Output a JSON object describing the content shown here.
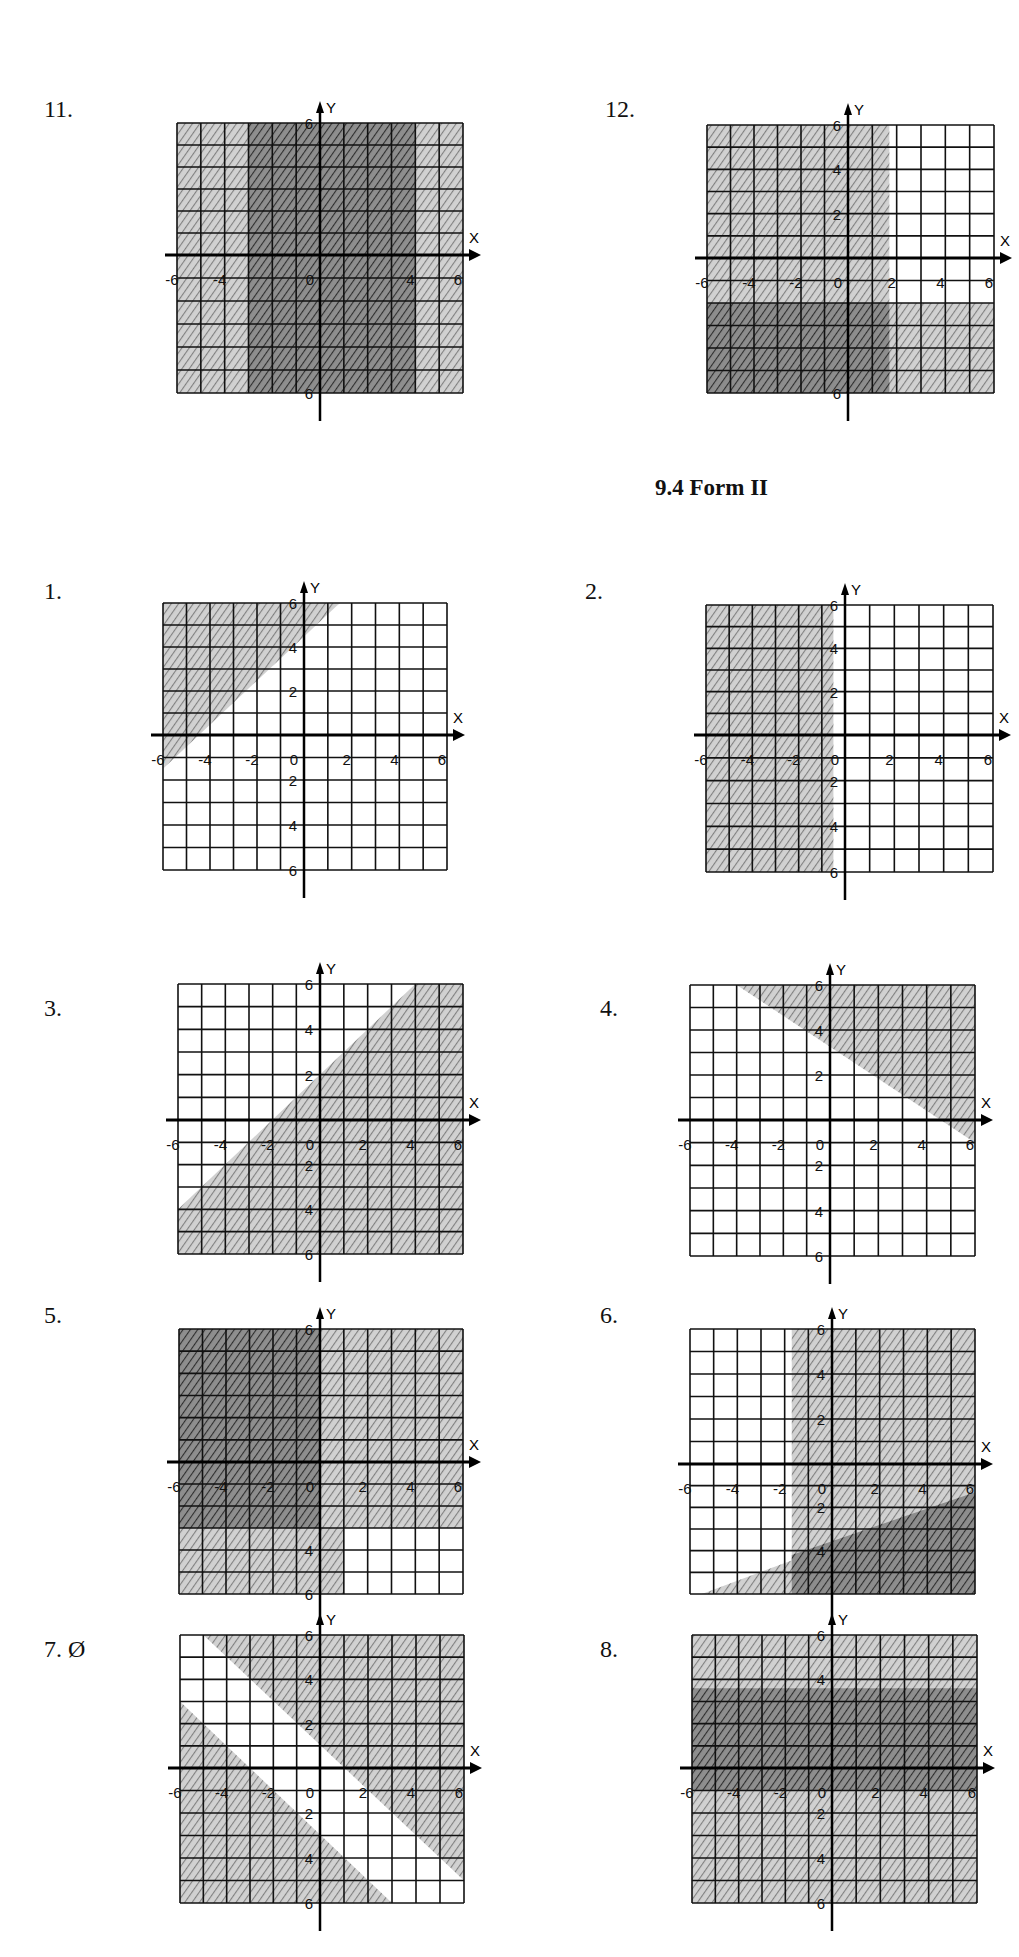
{
  "section_heading": "9.4 Form II",
  "problems": [
    {
      "label": "11.",
      "x": 44,
      "y": 96
    },
    {
      "label": "12.",
      "x": 605,
      "y": 96
    },
    {
      "label": "1.",
      "x": 44,
      "y": 578
    },
    {
      "label": "2.",
      "x": 585,
      "y": 578
    },
    {
      "label": "3.",
      "x": 44,
      "y": 995
    },
    {
      "label": "4.",
      "x": 600,
      "y": 995
    },
    {
      "label": "5.",
      "x": 44,
      "y": 1302
    },
    {
      "label": "6.",
      "x": 600,
      "y": 1302
    },
    {
      "label": "7. Ø",
      "x": 44,
      "y": 1636
    },
    {
      "label": "8.",
      "x": 600,
      "y": 1636
    }
  ],
  "colors": {
    "grid": "#111111",
    "shade_light": "#b5b5b5",
    "shade_dark": "#6e6e6e",
    "paper": "#ffffff"
  },
  "chart_data": [
    {
      "id": "11",
      "type": "region",
      "title": "11.",
      "xlabel": "X",
      "ylabel": "Y",
      "xlim": [
        -6,
        6
      ],
      "ylim": [
        -6,
        6
      ],
      "xticks": [
        -6,
        -4,
        0,
        4,
        6
      ],
      "yticks": [
        6,
        -6
      ],
      "box": [
        177,
        123,
        463,
        393
      ],
      "origin": [
        320,
        255
      ],
      "regions": [
        {
          "shade": "light",
          "poly": [
            [
              -6,
              6
            ],
            [
              6,
              6
            ],
            [
              6,
              -6
            ],
            [
              -6,
              -6
            ]
          ]
        },
        {
          "shade": "dark",
          "poly": [
            [
              -3,
              6
            ],
            [
              4,
              6
            ],
            [
              4,
              -6
            ],
            [
              -3,
              -6
            ]
          ]
        }
      ]
    },
    {
      "id": "12",
      "type": "region",
      "title": "12.",
      "xlabel": "X",
      "ylabel": "Y",
      "xlim": [
        -6,
        6
      ],
      "ylim": [
        -6,
        6
      ],
      "xticks": [
        -6,
        -4,
        -2,
        0,
        2,
        4,
        6
      ],
      "yticks": [
        6,
        4,
        2,
        -6
      ],
      "box": [
        707,
        125,
        994,
        393
      ],
      "origin": [
        848,
        258
      ],
      "regions": [
        {
          "shade": "light",
          "poly": [
            [
              -6,
              6
            ],
            [
              1.7,
              6
            ],
            [
              1.7,
              -6
            ],
            [
              -6,
              -6
            ]
          ]
        },
        {
          "shade": "light",
          "poly": [
            [
              -6,
              -2
            ],
            [
              6,
              -2
            ],
            [
              6,
              -6
            ],
            [
              -6,
              -6
            ]
          ]
        },
        {
          "shade": "dark",
          "poly": [
            [
              -6,
              -2
            ],
            [
              1.7,
              -2
            ],
            [
              1.7,
              -6
            ],
            [
              -6,
              -6
            ]
          ]
        }
      ]
    },
    {
      "id": "1",
      "type": "region",
      "title": "1.",
      "xlabel": "X",
      "ylabel": "Y",
      "xlim": [
        -6,
        6
      ],
      "ylim": [
        -6,
        6
      ],
      "xticks": [
        -6,
        -4,
        -2,
        0,
        2,
        4,
        6
      ],
      "yticks": [
        6,
        4,
        2,
        -2,
        -4,
        -6
      ],
      "box": [
        163,
        603,
        447,
        870
      ],
      "origin": [
        304,
        735
      ],
      "boundary": "y = x + 4.5",
      "regions": [
        {
          "shade": "light",
          "poly": [
            [
              -6,
              6
            ],
            [
              1.5,
              6
            ],
            [
              -6,
              -1.5
            ]
          ]
        }
      ]
    },
    {
      "id": "2",
      "type": "region",
      "title": "2.",
      "xlabel": "X",
      "ylabel": "Y",
      "xlim": [
        -6,
        6
      ],
      "ylim": [
        -6,
        6
      ],
      "xticks": [
        -6,
        -4,
        -2,
        0,
        2,
        4,
        6
      ],
      "yticks": [
        6,
        4,
        2,
        -2,
        -4,
        -6
      ],
      "box": [
        706,
        605,
        993,
        872
      ],
      "origin": [
        845,
        735
      ],
      "boundary": "x = -0.5",
      "regions": [
        {
          "shade": "light",
          "poly": [
            [
              -6,
              6
            ],
            [
              -0.5,
              6
            ],
            [
              -0.5,
              -6
            ],
            [
              -6,
              -6
            ]
          ]
        }
      ]
    },
    {
      "id": "3",
      "type": "region",
      "title": "3.",
      "xlabel": "X",
      "ylabel": "Y",
      "xlim": [
        -6,
        6
      ],
      "ylim": [
        -6,
        6
      ],
      "xticks": [
        -6,
        -4,
        -2,
        0,
        2,
        4,
        6
      ],
      "yticks": [
        6,
        4,
        2,
        -2,
        -4,
        -6
      ],
      "box": [
        178,
        984,
        463,
        1254
      ],
      "origin": [
        320,
        1120
      ],
      "boundary": "y = x + 2",
      "regions": [
        {
          "shade": "light",
          "poly": [
            [
              4,
              6
            ],
            [
              6,
              6
            ],
            [
              6,
              -6
            ],
            [
              -6,
              -6
            ],
            [
              -6,
              -4
            ]
          ]
        }
      ]
    },
    {
      "id": "4",
      "type": "region",
      "title": "4.",
      "xlabel": "X",
      "ylabel": "Y",
      "xlim": [
        -6,
        6
      ],
      "ylim": [
        -6,
        6
      ],
      "xticks": [
        -6,
        -4,
        -2,
        0,
        2,
        4,
        6
      ],
      "yticks": [
        6,
        4,
        2,
        -2,
        -4,
        -6
      ],
      "box": [
        690,
        985,
        975,
        1256
      ],
      "origin": [
        830,
        1120
      ],
      "boundary": "y = -0.7x + 3.2",
      "regions": [
        {
          "shade": "light",
          "poly": [
            [
              -4,
              6
            ],
            [
              6,
              6
            ],
            [
              6,
              -1
            ]
          ]
        }
      ]
    },
    {
      "id": "5",
      "type": "region",
      "title": "5.",
      "xlabel": "X",
      "ylabel": "Y",
      "xlim": [
        -6,
        6
      ],
      "ylim": [
        -6,
        6
      ],
      "xticks": [
        -6,
        -4,
        -2,
        0,
        2,
        4,
        6
      ],
      "yticks": [
        6,
        -4,
        -6
      ],
      "box": [
        179,
        1329,
        463,
        1594
      ],
      "origin": [
        320,
        1462
      ],
      "regions": [
        {
          "shade": "light",
          "poly": [
            [
              -6,
              6
            ],
            [
              6,
              6
            ],
            [
              6,
              -3
            ],
            [
              1,
              -3
            ],
            [
              1,
              -6
            ],
            [
              -6,
              -6
            ]
          ]
        },
        {
          "shade": "dark",
          "poly": [
            [
              -6,
              6
            ],
            [
              0,
              6
            ],
            [
              0,
              -3
            ],
            [
              -6,
              -3
            ]
          ]
        }
      ]
    },
    {
      "id": "6",
      "type": "region",
      "title": "6.",
      "xlabel": "X",
      "ylabel": "Y",
      "xlim": [
        -6,
        6
      ],
      "ylim": [
        -6,
        6
      ],
      "xticks": [
        -6,
        -4,
        -2,
        0,
        2,
        4,
        6
      ],
      "yticks": [
        6,
        4,
        2,
        -2,
        -4
      ],
      "box": [
        690,
        1329,
        975,
        1594
      ],
      "origin": [
        832,
        1464
      ],
      "regions": [
        {
          "shade": "light",
          "poly": [
            [
              -1.7,
              6
            ],
            [
              6,
              6
            ],
            [
              6,
              -6
            ],
            [
              -1.7,
              -6
            ]
          ]
        },
        {
          "shade": "light",
          "poly": [
            [
              -5.5,
              -6
            ],
            [
              6,
              -1.3
            ],
            [
              6,
              -6
            ]
          ]
        },
        {
          "shade": "dark",
          "poly": [
            [
              -1.7,
              -4.2
            ],
            [
              6,
              -1.3
            ],
            [
              6,
              -6
            ],
            [
              -1.7,
              -6
            ]
          ]
        }
      ]
    },
    {
      "id": "7",
      "type": "region",
      "title": "7. Ø",
      "xlabel": "X",
      "ylabel": "Y",
      "xlim": [
        -6,
        6
      ],
      "ylim": [
        -6,
        6
      ],
      "xticks": [
        -6,
        -4,
        -2,
        0,
        2,
        4,
        6
      ],
      "yticks": [
        6,
        4,
        2,
        -2,
        -4,
        -6
      ],
      "box": [
        180,
        1635,
        464,
        1903
      ],
      "origin": [
        320,
        1768
      ],
      "boundaries": [
        "y = -x + 1",
        "y = -x - 3"
      ],
      "regions": [
        {
          "shade": "light",
          "poly": [
            [
              -5,
              6
            ],
            [
              6,
              6
            ],
            [
              6,
              -5
            ]
          ]
        },
        {
          "shade": "light",
          "poly": [
            [
              -6,
              3
            ],
            [
              3,
              -6
            ],
            [
              -6,
              -6
            ]
          ]
        }
      ]
    },
    {
      "id": "8",
      "type": "region",
      "title": "8.",
      "xlabel": "X",
      "ylabel": "Y",
      "xlim": [
        -6,
        6
      ],
      "ylim": [
        -6,
        6
      ],
      "xticks": [
        -6,
        -4,
        -2,
        0,
        2,
        4,
        6
      ],
      "yticks": [
        6,
        4,
        -2,
        -4,
        -6
      ],
      "box": [
        692,
        1635,
        977,
        1903
      ],
      "origin": [
        832,
        1768
      ],
      "regions": [
        {
          "shade": "light",
          "poly": [
            [
              -6,
              6
            ],
            [
              6,
              6
            ],
            [
              6,
              -6
            ],
            [
              -6,
              -6
            ]
          ]
        },
        {
          "shade": "dark",
          "poly": [
            [
              -6,
              3.6
            ],
            [
              6,
              3.6
            ],
            [
              6,
              -1
            ],
            [
              -6,
              -1
            ]
          ]
        }
      ]
    }
  ]
}
